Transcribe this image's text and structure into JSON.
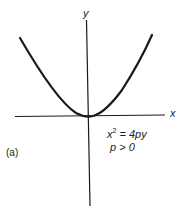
{
  "figure": {
    "panel_label": "(a)",
    "axes": {
      "x_label": "x",
      "y_label": "y"
    },
    "equation": {
      "lhs_var": "x",
      "lhs_exp": "2",
      "rhs": " = 4py"
    },
    "condition": "p > 0",
    "curve": {
      "type": "parabola",
      "opens": "up",
      "vertex": "origin"
    },
    "colors": {
      "line": "#1a1a1a",
      "background": "#ffffff"
    }
  }
}
